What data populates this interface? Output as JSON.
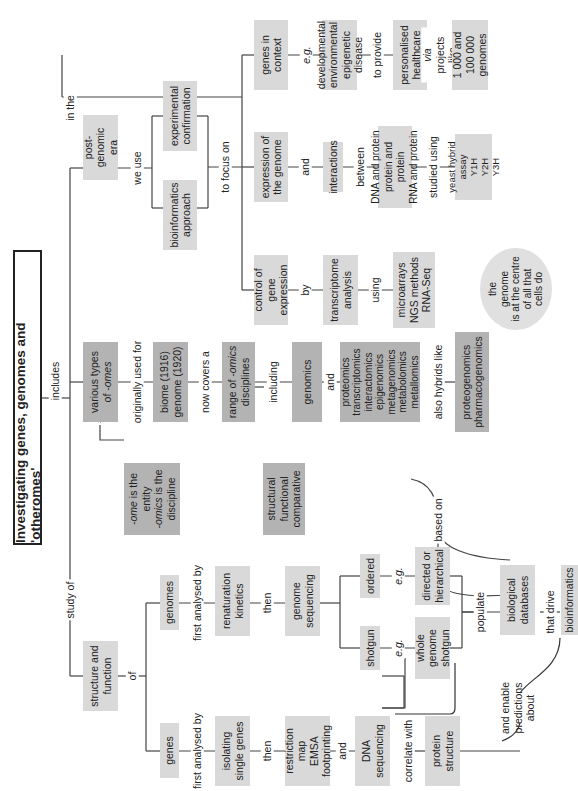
{
  "title": "Investigating genes, genomes and 'otheromes'",
  "connectors": {
    "includes": "includes",
    "in_the": "in the",
    "study_of": "study of",
    "we_use": "we use",
    "to_focus_on": "to focus on",
    "eg_1": "e.g.",
    "to_provide": "to provide",
    "via_projects_like": "via projects like",
    "and_1": "and",
    "between": "between",
    "studied_using": "studied using",
    "by": "by",
    "using": "using",
    "originally_used_for": "originally used for",
    "now_covers_a": "now covers a",
    "including": "including",
    "and_2": "and",
    "also_hybrids_like": "also hybrids like",
    "based_on": "based on",
    "of": "of",
    "first_analysed_by_genomes": "first analysed by",
    "first_analysed_by_genes": "first analysed by",
    "then_genomes": "then",
    "then_genes": "then",
    "eg_ordered": "e.g.",
    "eg_shotgun": "e.g.",
    "populate": "populate",
    "that_drive": "that drive",
    "and_3": "and",
    "correlate_with": "correlate with",
    "and_enable_predictions_about": "and enable\npredictions\nabout"
  },
  "nodes": {
    "post_genomic_era": "post-genomic\nera",
    "experimental_confirmation": "experimental\nconfirmation",
    "bioinformatics_approach": "bioinformatics\napproach",
    "genes_in_context": "genes in\ncontext",
    "developmental_list": "developmental\nenvironmental\nepigenetic\ndisease",
    "personalised_healthcare": "personalised\nhealthcare",
    "genomes_projects": "1 000 and\n100 000\ngenomes",
    "expression_of_genome": "expression of\nthe genome",
    "interactions": "interactions",
    "interaction_types": "DNA and protein\nprotein and protein\nRNA and protein",
    "yeast_hybrid": "yeast hybrid\nassay\nY1H\nY2H\nY3H",
    "control_gene_expression": "control of gene\nexpression",
    "transcriptome_analysis": "transcriptome\nanalysis",
    "methods": "microarrays\nNGS methods\nRNA-Seq",
    "genome_centre": "the\ngenome\nis at the centre\nof all that\ncells do",
    "various_omes": "various types\nof -omes",
    "ome_entity": "-ome is the\nentity\n-omics is the\ndiscipline",
    "biome_genome": "biome (1916)\ngenome (1920)",
    "range_omics": "range of -omics\ndisciplines",
    "genomics": "genomics",
    "genomics_types": "structural\nfunctional\ncomparative",
    "omics_list": "proteomics\ntranscriptomics\ninteractomics\nepigenomics\nmetagenomics\nmetabolomics\nmetallomics",
    "hybrids": "proteogenomics\npharmacogenomics",
    "structure_function": "structure and\nfunction",
    "genomes": "genomes",
    "genes": "genes",
    "renaturation_kinetics": "renaturation\nkinetics",
    "isolating_single_genes": "isolating\nsingle genes",
    "genome_sequencing": "genome\nsequencing",
    "restriction_map": "restriction map\nEMSA\nfootprinting",
    "ordered": "ordered",
    "shotgun": "shotgun",
    "directed_hierarchical": "directed or\nhierarchical",
    "whole_genome_shotgun": "whole genome\nshotgun",
    "dna_sequencing": "DNA\nsequencing",
    "protein_structure": "protein\nstructure",
    "biological_databases": "biological\ndatabases",
    "bioinformatics": "bioinformatics"
  }
}
